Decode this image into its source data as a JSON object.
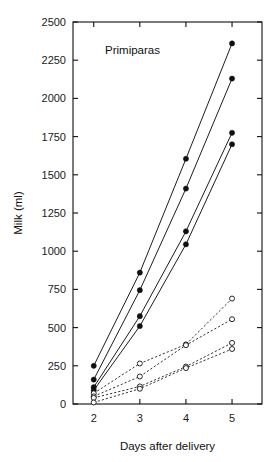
{
  "runhead": {
    "text": ""
  },
  "figure": {
    "annotation": "Primiparas"
  },
  "chart_data": {
    "type": "line",
    "title": "",
    "subtitle": "",
    "annotation": "Primiparas",
    "xlabel": "Days after delivery",
    "ylabel": "Milk (ml)",
    "x": [
      2,
      3,
      4,
      5
    ],
    "xtick_labels": [
      "2",
      "3",
      "4",
      "5"
    ],
    "xlim": [
      1.55,
      5.65
    ],
    "ylim": [
      0,
      2500
    ],
    "ytick_values": [
      0,
      250,
      500,
      750,
      1000,
      1250,
      1500,
      1750,
      2000,
      2250,
      2500
    ],
    "ytick_labels": [
      "0",
      "250",
      "500",
      "750",
      "1000",
      "1250",
      "1500",
      "1750",
      "2000",
      "2250",
      "2500"
    ],
    "grid": false,
    "legend": "none",
    "axis_box": true,
    "tick_direction": "in",
    "colors": {
      "ink": "#101010",
      "background": "#ffffff"
    },
    "series": [
      {
        "name": "Subject 1",
        "marker": "filled-circle",
        "line": "solid",
        "values": [
          250,
          860,
          1605,
          2360
        ]
      },
      {
        "name": "Subject 2",
        "marker": "filled-circle",
        "line": "solid",
        "values": [
          160,
          745,
          1410,
          2130
        ]
      },
      {
        "name": "Subject 3",
        "marker": "filled-circle",
        "line": "solid",
        "values": [
          110,
          575,
          1130,
          1775
        ]
      },
      {
        "name": "Subject 4",
        "marker": "filled-circle",
        "line": "solid",
        "values": [
          90,
          510,
          1045,
          1700
        ]
      },
      {
        "name": "Subject 5",
        "marker": "open-circle",
        "line": "dashed",
        "values": [
          70,
          265,
          390,
          690
        ]
      },
      {
        "name": "Subject 6",
        "marker": "open-circle",
        "line": "dashed",
        "values": [
          50,
          180,
          385,
          555
        ]
      },
      {
        "name": "Subject 7",
        "marker": "open-circle",
        "line": "dashed",
        "values": [
          40,
          115,
          245,
          400
        ]
      },
      {
        "name": "Subject 8",
        "marker": "open-circle",
        "line": "dashed",
        "values": [
          10,
          100,
          235,
          360
        ]
      }
    ]
  }
}
